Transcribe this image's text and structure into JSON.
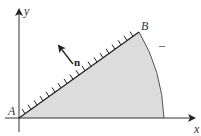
{
  "diagram": {
    "axes": {
      "x_label": "x",
      "y_label": "y"
    },
    "points": {
      "A": "A",
      "B": "B"
    },
    "normal_label": "n",
    "tick_mark": "–",
    "colors": {
      "region_fill": "#dcdcdc",
      "line": "#333333",
      "hatch": "#222222",
      "arc": "#555555"
    }
  }
}
